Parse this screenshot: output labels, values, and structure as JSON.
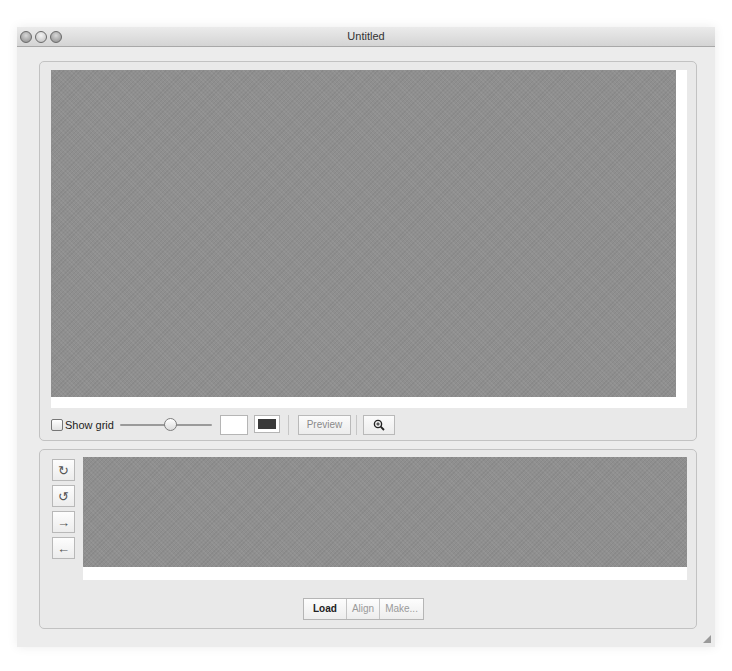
{
  "window": {
    "title": "Untitled",
    "traffic_lights": [
      "close",
      "minimize",
      "zoom"
    ]
  },
  "top_panel": {
    "canvas_color": "#8f8f8f",
    "toolbar": {
      "show_grid_label": "Show grid",
      "show_grid_checked": false,
      "slider_position_pct": 50,
      "background_color_swatch": "#ffffff",
      "foreground_color_swatch": "#3a3a3a",
      "preview_label": "Preview",
      "zoom_icon": "magnifier-plus-icon"
    }
  },
  "bottom_panel": {
    "canvas_color": "#8f8f8f",
    "side_buttons": [
      {
        "name": "rotate-clockwise",
        "glyph": "↻"
      },
      {
        "name": "rotate-counterclockwise",
        "glyph": "↺"
      },
      {
        "name": "move-right",
        "glyph": "→"
      },
      {
        "name": "move-left",
        "glyph": "←"
      }
    ],
    "segmented": [
      {
        "label": "Load",
        "active": true
      },
      {
        "label": "Align",
        "active": false
      },
      {
        "label": "Make...",
        "active": false
      }
    ]
  }
}
